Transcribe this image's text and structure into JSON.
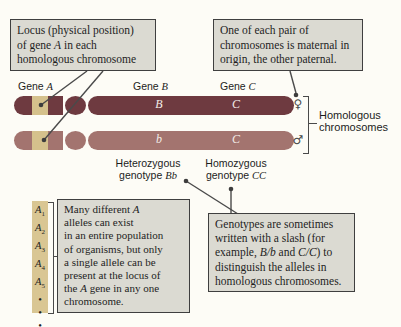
{
  "colors": {
    "chromosome_maternal": "#6e3a40",
    "chromosome_paternal": "#a3746f",
    "locus_highlight": "#d5c18c",
    "allele_strip_bg": "#d9c693",
    "callout_bg": "#dbdad2",
    "callout_border": "#3f3f3f",
    "pointer_line": "#4a4a4a",
    "chromosome_letter": "#f2ece7"
  },
  "boxes": {
    "locus": [
      [
        "Locus (physical position)"
      ],
      [
        "of gene ",
        {
          "t": "A",
          "i": 1
        },
        " in each"
      ],
      [
        "homologous chromosome"
      ]
    ],
    "maternal_origin": [
      [
        "One of each pair of"
      ],
      [
        "chromosomes is maternal in"
      ],
      [
        "origin, the other paternal."
      ]
    ],
    "many_alleles": [
      [
        "Many different ",
        {
          "t": "A",
          "i": 1
        }
      ],
      [
        "alleles can exist"
      ],
      [
        "in an entire population"
      ],
      [
        "of organisms, but only"
      ],
      [
        "a single allele can be"
      ],
      [
        "present at the locus of"
      ],
      [
        "the ",
        {
          "t": "A",
          "i": 1
        },
        " gene in any one"
      ],
      [
        "chromosome."
      ]
    ],
    "genotype_notation": [
      [
        "Genotypes are sometimes"
      ],
      [
        "written with a slash (for"
      ],
      [
        "example, ",
        {
          "t": "B/b",
          "i": 1
        },
        " and ",
        {
          "t": "C/C",
          "i": 1
        },
        ") to"
      ],
      [
        "distinguish the alleles in"
      ],
      [
        "homologous chromosomes."
      ]
    ]
  },
  "gene_labels": {
    "gene_a": [
      [
        "Gene ",
        {
          "t": "A",
          "i": 1
        }
      ]
    ],
    "gene_b": [
      [
        "Gene ",
        {
          "t": "B",
          "i": 1
        }
      ]
    ],
    "gene_c": [
      [
        "Gene ",
        {
          "t": "C",
          "i": 1
        }
      ]
    ]
  },
  "chromosomes": {
    "maternal": {
      "allele_b": "B",
      "allele_c": "C",
      "sex_symbol": "♀"
    },
    "paternal": {
      "allele_b": "b",
      "allele_c": "C",
      "sex_symbol": "♂"
    }
  },
  "labels": {
    "homologous": [
      [
        "Homologous"
      ],
      [
        "chromosomes"
      ]
    ],
    "heterozygous": [
      [
        "Heterozygous"
      ],
      [
        "genotype ",
        {
          "t": "Bb",
          "i": 1
        }
      ]
    ],
    "homozygous": [
      [
        "Homozygous"
      ],
      [
        "genotype ",
        {
          "t": "CC",
          "i": 1
        }
      ]
    ]
  },
  "allele_strip": [
    [
      {
        "t": "A",
        "i": 1
      },
      {
        "t": "1",
        "sub": 1
      }
    ],
    [
      {
        "t": "A",
        "i": 1
      },
      {
        "t": "2",
        "sub": 1
      }
    ],
    [
      {
        "t": "A",
        "i": 1
      },
      {
        "t": "3",
        "sub": 1
      }
    ],
    [
      {
        "t": "A",
        "i": 1
      },
      {
        "t": "4",
        "sub": 1
      }
    ],
    [
      {
        "t": "A",
        "i": 1
      },
      {
        "t": "5",
        "sub": 1
      }
    ],
    [
      "•"
    ],
    [
      "•"
    ],
    [
      "•"
    ]
  ]
}
